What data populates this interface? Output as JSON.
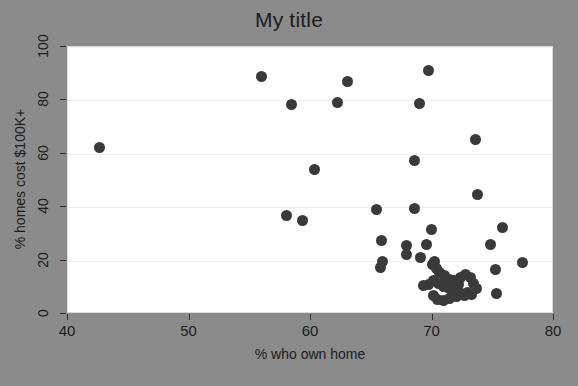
{
  "chart_data": {
    "type": "scatter",
    "title": "My title",
    "xlabel": "% who own home",
    "ylabel": "% homes cost $100K+",
    "xlim": [
      40,
      80
    ],
    "ylim": [
      0,
      100
    ],
    "xticks": [
      40,
      50,
      60,
      70,
      80
    ],
    "yticks": [
      0,
      20,
      40,
      60,
      80,
      100
    ],
    "grid": "horizontal",
    "legend": "none",
    "marker": {
      "shape": "circle",
      "color": "#3a3a3a",
      "size_px": 11
    },
    "panel_background": "#ffffff",
    "figure_background": "#8b8b8b",
    "gridline_color": "#efefef",
    "points": [
      {
        "x": 42.6,
        "y": 62.2
      },
      {
        "x": 55.9,
        "y": 88.8
      },
      {
        "x": 58.4,
        "y": 78.6
      },
      {
        "x": 62.2,
        "y": 79.4
      },
      {
        "x": 63.0,
        "y": 87.0
      },
      {
        "x": 69.7,
        "y": 91.2
      },
      {
        "x": 68.9,
        "y": 79.0
      },
      {
        "x": 73.5,
        "y": 65.3
      },
      {
        "x": 68.5,
        "y": 57.6
      },
      {
        "x": 60.3,
        "y": 54.3
      },
      {
        "x": 73.7,
        "y": 44.8
      },
      {
        "x": 65.4,
        "y": 39.2
      },
      {
        "x": 68.5,
        "y": 39.5
      },
      {
        "x": 58.0,
        "y": 37.0
      },
      {
        "x": 59.3,
        "y": 35.0
      },
      {
        "x": 75.8,
        "y": 32.3
      },
      {
        "x": 69.9,
        "y": 31.8
      },
      {
        "x": 65.8,
        "y": 27.7
      },
      {
        "x": 69.5,
        "y": 26.1
      },
      {
        "x": 67.9,
        "y": 25.8
      },
      {
        "x": 74.8,
        "y": 26.2
      },
      {
        "x": 67.9,
        "y": 22.3
      },
      {
        "x": 77.4,
        "y": 19.4
      },
      {
        "x": 65.9,
        "y": 19.5
      },
      {
        "x": 65.7,
        "y": 17.3
      },
      {
        "x": 75.2,
        "y": 16.7
      },
      {
        "x": 70.2,
        "y": 19.8
      },
      {
        "x": 70.0,
        "y": 18.6
      },
      {
        "x": 70.3,
        "y": 17.2
      },
      {
        "x": 70.6,
        "y": 15.6
      },
      {
        "x": 71.0,
        "y": 14.3
      },
      {
        "x": 71.4,
        "y": 13.1
      },
      {
        "x": 71.8,
        "y": 12.5
      },
      {
        "x": 72.3,
        "y": 13.7
      },
      {
        "x": 72.7,
        "y": 14.9
      },
      {
        "x": 73.1,
        "y": 13.5
      },
      {
        "x": 73.4,
        "y": 11.6
      },
      {
        "x": 73.6,
        "y": 9.5
      },
      {
        "x": 72.9,
        "y": 8.1
      },
      {
        "x": 72.4,
        "y": 7.6
      },
      {
        "x": 71.9,
        "y": 8.6
      },
      {
        "x": 71.4,
        "y": 9.4
      },
      {
        "x": 70.9,
        "y": 10.4
      },
      {
        "x": 70.5,
        "y": 11.6
      },
      {
        "x": 70.1,
        "y": 12.6
      },
      {
        "x": 69.7,
        "y": 11.0
      },
      {
        "x": 69.3,
        "y": 10.6
      },
      {
        "x": 70.1,
        "y": 7.0
      },
      {
        "x": 70.4,
        "y": 5.3
      },
      {
        "x": 70.9,
        "y": 5.0
      },
      {
        "x": 71.4,
        "y": 5.8
      },
      {
        "x": 72.0,
        "y": 6.4
      },
      {
        "x": 72.6,
        "y": 6.9
      },
      {
        "x": 73.2,
        "y": 7.3
      },
      {
        "x": 75.3,
        "y": 7.6
      },
      {
        "x": 71.2,
        "y": 11.2
      },
      {
        "x": 72.1,
        "y": 11.0
      },
      {
        "x": 69.0,
        "y": 21.0
      }
    ]
  },
  "axes": {
    "x_tick_labels": [
      "40",
      "50",
      "60",
      "70",
      "80"
    ],
    "y_tick_labels": [
      "0",
      "20",
      "40",
      "60",
      "80",
      "100"
    ]
  }
}
